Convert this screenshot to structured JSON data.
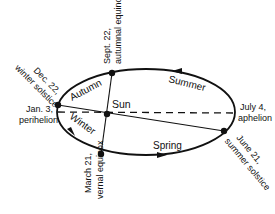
{
  "diagram": {
    "type": "earth-orbit",
    "center_label": "Sun",
    "seasons": [
      "Autumn",
      "Summer",
      "Winter",
      "Spring"
    ],
    "points": {
      "winter_solstice": [
        "Dec. 22,",
        "winter solstice"
      ],
      "autumnal_equinox": [
        "Sept. 22,",
        "autumnal equinox"
      ],
      "perihelion": [
        "Jan. 3,",
        "perihelion"
      ],
      "aphelion": [
        "July 4,",
        "aphelion"
      ],
      "vernal_equinox": [
        "March 21,",
        "vernal equinox"
      ],
      "summer_solstice": [
        "June 21,",
        "summer solstice"
      ]
    },
    "colors": {
      "stroke": "#111111",
      "background": "#ffffff"
    }
  }
}
